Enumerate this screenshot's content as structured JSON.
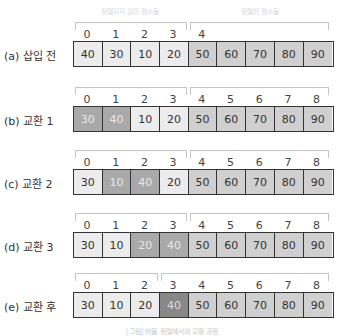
{
  "headers": {
    "unsorted": "정렬되지 않은 원소들",
    "sorted": "정렬된 원소들"
  },
  "rows": [
    {
      "label": "(a) 삽입 전",
      "split": 4,
      "indices": [
        "0",
        "1",
        "2",
        "3",
        "4",
        "",
        "",
        "",
        ""
      ],
      "values": [
        "40",
        "30",
        "10",
        "20",
        "50",
        "60",
        "70",
        "80",
        "90"
      ],
      "states": [
        "u",
        "u",
        "u",
        "u",
        "s",
        "s",
        "s",
        "s",
        "s"
      ]
    },
    {
      "label": "(b) 교환 1",
      "split": 4,
      "indices": [
        "0",
        "1",
        "2",
        "3",
        "4",
        "5",
        "6",
        "7",
        "8"
      ],
      "values": [
        "30",
        "40",
        "10",
        "20",
        "50",
        "60",
        "70",
        "80",
        "90"
      ],
      "states": [
        "w",
        "w",
        "u",
        "u",
        "s",
        "s",
        "s",
        "s",
        "s"
      ]
    },
    {
      "label": "(c) 교환 2",
      "split": 4,
      "indices": [
        "0",
        "1",
        "2",
        "3",
        "4",
        "5",
        "6",
        "7",
        "8"
      ],
      "values": [
        "30",
        "10",
        "40",
        "20",
        "50",
        "60",
        "70",
        "80",
        "90"
      ],
      "states": [
        "u",
        "w",
        "w",
        "u",
        "s",
        "s",
        "s",
        "s",
        "s"
      ]
    },
    {
      "label": "(d) 교환 3",
      "split": 4,
      "indices": [
        "0",
        "1",
        "2",
        "3",
        "4",
        "5",
        "6",
        "7",
        "8"
      ],
      "values": [
        "30",
        "10",
        "20",
        "40",
        "50",
        "60",
        "70",
        "80",
        "90"
      ],
      "states": [
        "u",
        "u",
        "w",
        "w",
        "s",
        "s",
        "s",
        "s",
        "s"
      ]
    },
    {
      "label": "(e) 교환 후",
      "split": 3,
      "indices": [
        "0",
        "1",
        "2",
        "3",
        "4",
        "5",
        "6",
        "7",
        "8"
      ],
      "values": [
        "30",
        "10",
        "20",
        "40",
        "50",
        "60",
        "70",
        "80",
        "90"
      ],
      "states": [
        "u",
        "u",
        "u",
        "f",
        "s",
        "s",
        "s",
        "s",
        "s"
      ]
    }
  ],
  "caption": "[그림] 버블 정렬에서의 교환 과정",
  "colors": {
    "unsorted_cell": "#ececec",
    "sorted_cell": "#d0d0d0",
    "swapped_cell": "#a9a9a9",
    "placed_cell": "#888888",
    "border": "#333333",
    "bracket": "#c4c4c4"
  }
}
